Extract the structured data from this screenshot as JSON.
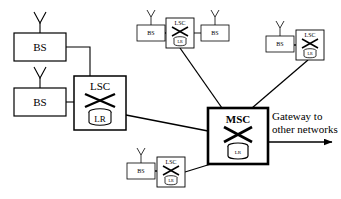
{
  "diagram": {
    "colors": {
      "background": "#ffffff",
      "stroke": "#000000",
      "text": "#000000"
    },
    "labels": {
      "bs": "BS",
      "lsc": "LSC",
      "lr": "LR",
      "msc": "MSC",
      "gateway_line1": "Gateway to",
      "gateway_line2": "other networks"
    },
    "nodes": [
      {
        "id": "bs-left-top",
        "type": "bs",
        "label": "BS",
        "x": 14,
        "y": 33,
        "w": 52,
        "h": 28,
        "antenna": true,
        "stroke": 1.2,
        "font": 11
      },
      {
        "id": "bs-left-bottom",
        "type": "bs",
        "label": "BS",
        "x": 14,
        "y": 88,
        "w": 52,
        "h": 28,
        "antenna": true,
        "stroke": 1.2,
        "font": 11
      },
      {
        "id": "lsc-left",
        "type": "lsc",
        "label": "LSC",
        "x": 74,
        "y": 76,
        "w": 52,
        "h": 54,
        "antenna": false,
        "stroke": 1.5,
        "font": 11,
        "lr": "LR",
        "lr_font": 9
      },
      {
        "id": "bs-top-left",
        "type": "bs",
        "label": "BS",
        "x": 137,
        "y": 25,
        "w": 28,
        "h": 16,
        "antenna": true,
        "stroke": 0.8,
        "font": 6
      },
      {
        "id": "lsc-top",
        "type": "lsc",
        "label": "LSC",
        "x": 166,
        "y": 18,
        "w": 28,
        "h": 30,
        "antenna": false,
        "stroke": 0.9,
        "font": 6,
        "lr": "LR",
        "lr_font": 4
      },
      {
        "id": "bs-top-right",
        "type": "bs",
        "label": "BS",
        "x": 201,
        "y": 25,
        "w": 28,
        "h": 16,
        "antenna": true,
        "stroke": 0.8,
        "font": 6
      },
      {
        "id": "bs-right",
        "type": "bs",
        "label": "BS",
        "x": 266,
        "y": 36,
        "w": 28,
        "h": 16,
        "antenna": true,
        "stroke": 0.8,
        "font": 6
      },
      {
        "id": "lsc-right",
        "type": "lsc",
        "label": "LSC",
        "x": 296,
        "y": 30,
        "w": 28,
        "h": 30,
        "antenna": false,
        "stroke": 0.9,
        "font": 6,
        "lr": "LR",
        "lr_font": 4
      },
      {
        "id": "bs-bottom",
        "type": "bs",
        "label": "BS",
        "x": 127,
        "y": 163,
        "w": 28,
        "h": 16,
        "antenna": true,
        "stroke": 0.8,
        "font": 6
      },
      {
        "id": "lsc-bottom",
        "type": "lsc",
        "label": "LSC",
        "x": 157,
        "y": 157,
        "w": 28,
        "h": 30,
        "antenna": false,
        "stroke": 0.9,
        "font": 6,
        "lr": "LR",
        "lr_font": 4
      },
      {
        "id": "msc-center",
        "type": "msc",
        "label": "MSC",
        "x": 208,
        "y": 108,
        "w": 60,
        "h": 56,
        "antenna": false,
        "stroke": 2.6,
        "font": 11,
        "lr": "LR",
        "lr_font": 5
      }
    ],
    "links": [
      {
        "id": "link-bs-left-top-to-lsc-left",
        "from": "bs-left-top",
        "to": "lsc-left",
        "style": "orthogonal"
      },
      {
        "id": "link-bs-left-bottom-to-lsc-left",
        "from": "bs-left-bottom",
        "to": "lsc-left",
        "style": "straight"
      },
      {
        "id": "link-lsc-left-to-msc",
        "from": "lsc-left",
        "to": "msc-center",
        "style": "straight"
      },
      {
        "id": "link-bs-top-left-to-lsc-top",
        "from": "bs-top-left",
        "to": "lsc-top",
        "style": "straight"
      },
      {
        "id": "link-lsc-top-to-bs-top-right",
        "from": "lsc-top",
        "to": "bs-top-right",
        "style": "straight"
      },
      {
        "id": "link-lsc-top-to-msc",
        "from": "lsc-top",
        "to": "msc-center",
        "style": "straight"
      },
      {
        "id": "link-bs-right-to-lsc-right",
        "from": "bs-right",
        "to": "lsc-right",
        "style": "straight"
      },
      {
        "id": "link-lsc-right-to-msc",
        "from": "lsc-right",
        "to": "msc-center",
        "style": "straight"
      },
      {
        "id": "link-bs-bottom-to-lsc-bottom",
        "from": "bs-bottom",
        "to": "lsc-bottom",
        "style": "straight"
      },
      {
        "id": "link-lsc-bottom-to-msc",
        "from": "lsc-bottom",
        "to": "msc-center",
        "style": "straight"
      }
    ],
    "gateway": {
      "label_line1": "Gateway to",
      "label_line2": "other networks",
      "arrow": true,
      "font": 11
    }
  }
}
